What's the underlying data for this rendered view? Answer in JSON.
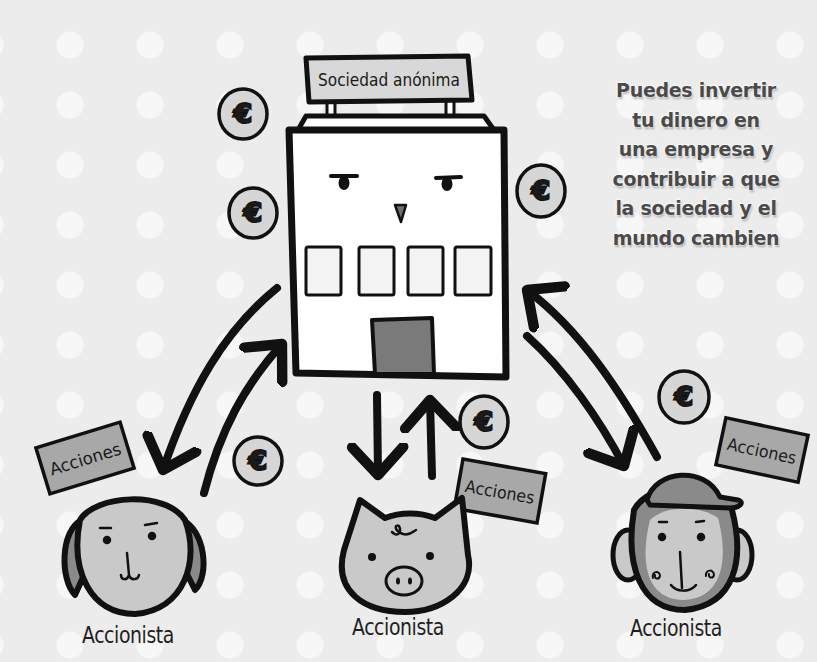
{
  "company": {
    "sign_label": "Sociedad anónima"
  },
  "caption": {
    "lines": [
      "Puedes invertir",
      "tu dinero en",
      "una empresa y",
      "contribuir a que",
      "la sociedad y el",
      "mundo cambien"
    ]
  },
  "coins": {
    "symbol": "€",
    "count": 7
  },
  "shares_cards": {
    "label": "Acciones",
    "count": 3
  },
  "shareholders": [
    {
      "character": "dog",
      "label": "Accionista"
    },
    {
      "character": "pig",
      "label": "Accionista"
    },
    {
      "character": "monkey",
      "label": "Accionista"
    }
  ],
  "colors": {
    "background": "#ececec",
    "dots": "#f7f7f7",
    "outline": "#111111",
    "building": "#ffffff",
    "sign": "#d8d8d8",
    "door": "#7a7a7a",
    "coin": "#d6d6d6",
    "card": "#a8a8a8",
    "face_light": "#c9c9c9",
    "face_dark": "#8a8a8a",
    "caption_text": "#4a4a4a"
  }
}
